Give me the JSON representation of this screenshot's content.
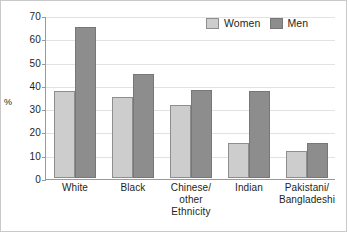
{
  "chart_data": {
    "type": "bar",
    "title": "",
    "xlabel": "Ethnicity",
    "ylabel": "%",
    "ylim": [
      0,
      70
    ],
    "ytick_step": 10,
    "yticks": [
      70,
      60,
      50,
      40,
      30,
      20,
      10,
      0
    ],
    "grid": true,
    "legend_position": "top-right",
    "categories": [
      "White",
      "Chinese/\nother",
      "Black",
      "Indian",
      "Pakistani/\nBangladeshi"
    ],
    "category_lines": [
      [
        "White"
      ],
      [
        "Black"
      ],
      [
        "Chinese/",
        "other"
      ],
      [
        "Indian"
      ],
      [
        "Pakistani/",
        "Bangladeshi"
      ]
    ],
    "series": [
      {
        "name": "Women",
        "color": "#cdcdcd",
        "values": [
          37.5,
          35,
          31.5,
          15,
          11.5
        ]
      },
      {
        "name": "Men",
        "color": "#8d8d8d",
        "values": [
          65,
          44.5,
          38,
          37.5,
          15
        ]
      }
    ]
  },
  "legend": {
    "entries": [
      {
        "label": "Women",
        "swatch": "women-swatch"
      },
      {
        "label": "Men",
        "swatch": "men-swatch"
      }
    ]
  }
}
